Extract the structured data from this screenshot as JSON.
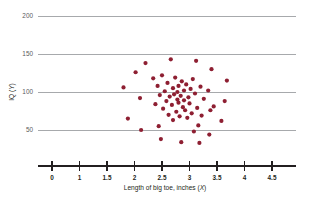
{
  "chart_data": {
    "type": "scatter",
    "title": "",
    "xlabel": "Length of big toe, inches (X)",
    "ylabel": "IQ (Y)",
    "xlabel_prefix": "Length of big toe, inches (",
    "xlabel_var": "X",
    "xlabel_suffix": ")",
    "ylabel_prefix": "IQ (",
    "ylabel_var": "Y",
    "ylabel_suffix": ")",
    "xticks": [
      "0",
      "1",
      "1.5",
      "2",
      "2.5",
      "3",
      "3.5",
      "4",
      "4.5"
    ],
    "yticks": [
      "200",
      "150",
      "100",
      "50"
    ],
    "ytick_values": [
      200,
      150,
      100,
      50
    ],
    "ylim": [
      35,
      215
    ],
    "xlim": [
      0,
      5
    ],
    "grid": "horizontal",
    "legend": "none",
    "point_color": "#8e1f32",
    "grid_color": "#a7a9ac",
    "axis_color": "#231f20",
    "background": "#ffffff",
    "n_points": 62,
    "correlation": "none",
    "points": [
      {
        "x": 1.8,
        "y": 106
      },
      {
        "x": 1.88,
        "y": 65
      },
      {
        "x": 2.02,
        "y": 126
      },
      {
        "x": 2.1,
        "y": 92
      },
      {
        "x": 2.12,
        "y": 50
      },
      {
        "x": 2.2,
        "y": 138
      },
      {
        "x": 2.34,
        "y": 118
      },
      {
        "x": 2.38,
        "y": 84
      },
      {
        "x": 2.42,
        "y": 108
      },
      {
        "x": 2.44,
        "y": 55
      },
      {
        "x": 2.46,
        "y": 96
      },
      {
        "x": 2.48,
        "y": 38
      },
      {
        "x": 2.5,
        "y": 122
      },
      {
        "x": 2.52,
        "y": 78
      },
      {
        "x": 2.55,
        "y": 101
      },
      {
        "x": 2.58,
        "y": 88
      },
      {
        "x": 2.6,
        "y": 112
      },
      {
        "x": 2.62,
        "y": 70
      },
      {
        "x": 2.64,
        "y": 94
      },
      {
        "x": 2.66,
        "y": 143
      },
      {
        "x": 2.68,
        "y": 83
      },
      {
        "x": 2.7,
        "y": 105
      },
      {
        "x": 2.7,
        "y": 63
      },
      {
        "x": 2.72,
        "y": 97
      },
      {
        "x": 2.74,
        "y": 119
      },
      {
        "x": 2.76,
        "y": 74
      },
      {
        "x": 2.78,
        "y": 90
      },
      {
        "x": 2.78,
        "y": 100
      },
      {
        "x": 2.8,
        "y": 86
      },
      {
        "x": 2.8,
        "y": 108
      },
      {
        "x": 2.82,
        "y": 68
      },
      {
        "x": 2.84,
        "y": 95
      },
      {
        "x": 2.85,
        "y": 34
      },
      {
        "x": 2.86,
        "y": 114
      },
      {
        "x": 2.88,
        "y": 80
      },
      {
        "x": 2.9,
        "y": 102
      },
      {
        "x": 2.9,
        "y": 89
      },
      {
        "x": 2.92,
        "y": 76
      },
      {
        "x": 2.94,
        "y": 110
      },
      {
        "x": 2.96,
        "y": 66
      },
      {
        "x": 2.98,
        "y": 93
      },
      {
        "x": 3.0,
        "y": 85
      },
      {
        "x": 3.02,
        "y": 104
      },
      {
        "x": 3.04,
        "y": 72
      },
      {
        "x": 3.06,
        "y": 117
      },
      {
        "x": 3.08,
        "y": 48
      },
      {
        "x": 3.1,
        "y": 98
      },
      {
        "x": 3.12,
        "y": 141
      },
      {
        "x": 3.14,
        "y": 79
      },
      {
        "x": 3.16,
        "y": 56
      },
      {
        "x": 3.18,
        "y": 33
      },
      {
        "x": 3.2,
        "y": 107
      },
      {
        "x": 3.22,
        "y": 69
      },
      {
        "x": 3.26,
        "y": 91
      },
      {
        "x": 3.34,
        "y": 102
      },
      {
        "x": 3.36,
        "y": 44
      },
      {
        "x": 3.38,
        "y": 76
      },
      {
        "x": 3.4,
        "y": 130
      },
      {
        "x": 3.44,
        "y": 81
      },
      {
        "x": 3.58,
        "y": 62
      },
      {
        "x": 3.64,
        "y": 88
      },
      {
        "x": 3.68,
        "y": 115
      }
    ]
  }
}
